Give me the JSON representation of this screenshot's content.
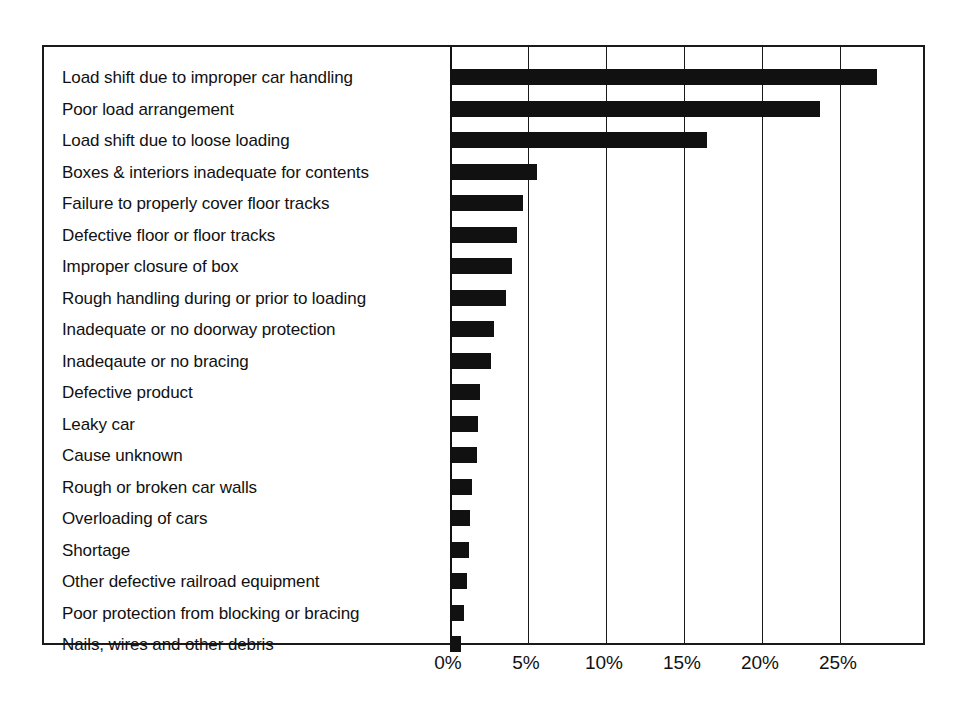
{
  "chart_data": {
    "type": "bar",
    "orientation": "horizontal",
    "title": "",
    "subtitle": "",
    "xlabel": "",
    "ylabel": "",
    "xlim": [
      0,
      30.4
    ],
    "ylim": null,
    "grid": true,
    "legend": null,
    "legend_position": "none",
    "value_unit": "%",
    "xticks": [
      0,
      5,
      10,
      15,
      20,
      25
    ],
    "xtick_labels": [
      "0%",
      "5%",
      "10%",
      "15%",
      "20%",
      "25%"
    ],
    "categories": [
      "Load shift due to improper car handling",
      "Poor load arrangement",
      "Load shift due to loose loading",
      "Boxes & interiors inadequate for contents",
      "Failure to properly cover floor tracks",
      "Defective floor or floor tracks",
      "Improper closure of box",
      "Rough handling during or prior to loading",
      "Inadequate or no doorway protection",
      "Inadeqaute or no bracing",
      "Defective product",
      "Leaky car",
      "Cause unknown",
      "Rough or broken car walls",
      "Overloading of cars",
      "Shortage",
      "Other defective railroad equipment",
      "Poor protection from blocking or bracing",
      "Nails, wires and other debris"
    ],
    "values": [
      27.4,
      23.7,
      16.5,
      5.6,
      4.7,
      4.3,
      4.0,
      3.6,
      2.8,
      2.6,
      1.9,
      1.8,
      1.7,
      1.4,
      1.3,
      1.2,
      1.1,
      0.9,
      0.7
    ],
    "bar_color": "#111111",
    "frame_color": "#1a1a1a",
    "background_color": "#ffffff"
  }
}
